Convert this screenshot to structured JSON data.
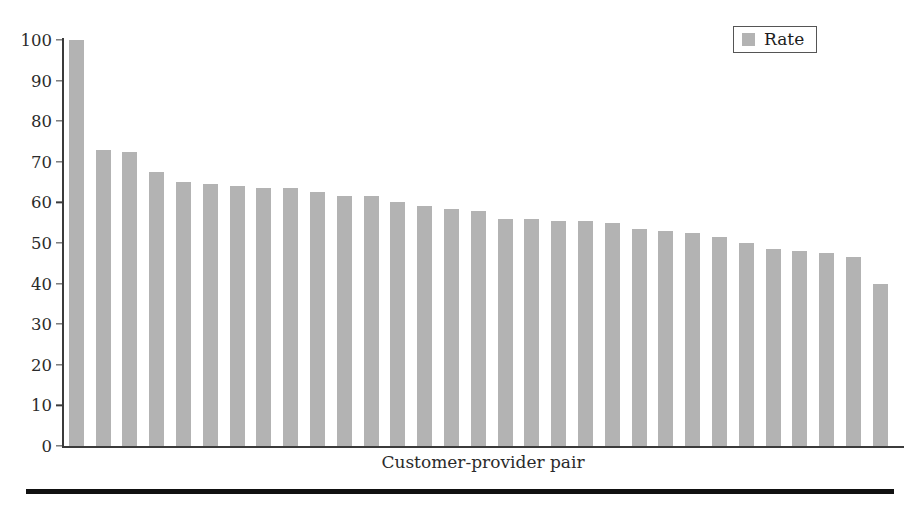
{
  "chart_data": {
    "type": "bar",
    "title": "",
    "subtitle": "",
    "xlabel": "Customer-provider pair",
    "ylabel": "",
    "ylim": [
      0,
      100
    ],
    "yticks": [
      0,
      10,
      20,
      30,
      40,
      50,
      60,
      70,
      80,
      90,
      100
    ],
    "ytick_labels": [
      "0",
      "10",
      "20",
      "30",
      "40",
      "50",
      "60",
      "70",
      "80",
      "90",
      "100"
    ],
    "xticks": [],
    "xtick_labels": [],
    "grid": false,
    "legend": {
      "position": "top-right",
      "entries": [
        {
          "label": "Rate",
          "color": "#b3b3b3"
        }
      ]
    },
    "series": [
      {
        "name": "Rate",
        "color": "#b3b3b3",
        "values": [
          100,
          73,
          72.5,
          67.5,
          65,
          64.5,
          64,
          63.5,
          63.5,
          62.5,
          61.5,
          61.5,
          60,
          59,
          58.5,
          58,
          56,
          56,
          55.5,
          55.5,
          55,
          53.5,
          53,
          52.5,
          51.5,
          50,
          48.5,
          48,
          47.5,
          46.5,
          40
        ]
      }
    ],
    "categories": [
      "pair-1",
      "pair-2",
      "pair-3",
      "pair-4",
      "pair-5",
      "pair-6",
      "pair-7",
      "pair-8",
      "pair-9",
      "pair-10",
      "pair-11",
      "pair-12",
      "pair-13",
      "pair-14",
      "pair-15",
      "pair-16",
      "pair-17",
      "pair-18",
      "pair-19",
      "pair-20",
      "pair-21",
      "pair-22",
      "pair-23",
      "pair-24",
      "pair-25",
      "pair-26",
      "pair-27",
      "pair-28",
      "pair-29",
      "pair-30",
      "pair-31"
    ],
    "bar_color": "#b3b3b3",
    "axis_color": "#3b3b3b",
    "text_color": "#2b2b2b",
    "background": "#ffffff"
  },
  "figure": {
    "bottom_rule_color": "#111111"
  }
}
